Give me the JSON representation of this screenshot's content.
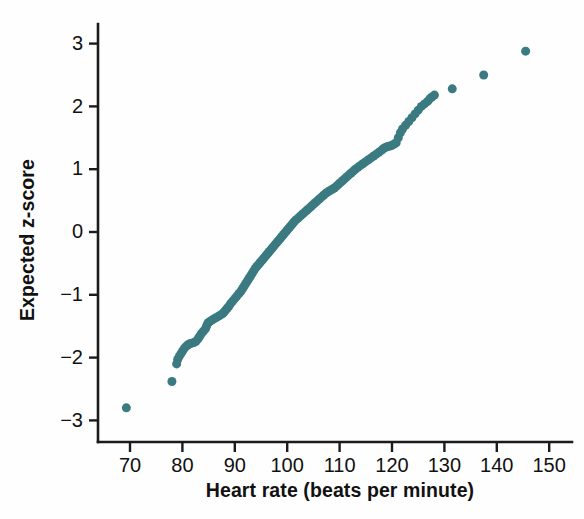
{
  "chart_data": {
    "type": "scatter",
    "title": "",
    "subtitle": "",
    "xlabel": "Heart rate (beats per minute)",
    "ylabel": "Expected z-score",
    "xlim": [
      66,
      152
    ],
    "ylim": [
      -3.35,
      3.35
    ],
    "xticks": [
      70,
      80,
      90,
      100,
      110,
      120,
      130,
      140,
      150
    ],
    "xticklabels": [
      "70",
      "80",
      "90",
      "100",
      "110",
      "120",
      "130",
      "140",
      "150"
    ],
    "yticks": [
      -3,
      -2,
      -1,
      0,
      1,
      2,
      3
    ],
    "yticklabels": [
      "−3",
      "−2",
      "−1",
      "0",
      "1",
      "2",
      "3"
    ],
    "grid": false,
    "legend": null,
    "marker": {
      "shape": "circle",
      "color": "#3a7a80",
      "size_px": 9,
      "opacity": 1
    },
    "series": [
      {
        "name": "Heart rate normal quantile plot",
        "color": "#3a7a80",
        "n_points": 136,
        "x": [
          69.3,
          78.0,
          78.9,
          79.1,
          79.4,
          79.7,
          80.0,
          80.3,
          80.6,
          81.0,
          81.4,
          81.8,
          82.2,
          82.6,
          83.0,
          83.3,
          83.6,
          84.0,
          84.4,
          84.6,
          84.8,
          85.0,
          85.3,
          85.7,
          86.1,
          86.5,
          86.9,
          87.3,
          87.7,
          88.0,
          88.3,
          88.6,
          88.9,
          89.2,
          89.6,
          90.0,
          90.4,
          90.8,
          91.2,
          91.5,
          91.8,
          92.1,
          92.4,
          92.7,
          93.0,
          93.3,
          93.6,
          93.9,
          94.2,
          94.5,
          94.8,
          95.1,
          95.4,
          95.7,
          96.0,
          96.3,
          96.6,
          96.9,
          97.2,
          97.5,
          97.8,
          98.1,
          98.4,
          98.7,
          99.0,
          99.3,
          99.6,
          99.9,
          100.2,
          100.5,
          100.8,
          101.1,
          101.4,
          101.8,
          102.2,
          102.6,
          103.0,
          103.4,
          103.8,
          104.2,
          104.6,
          105.0,
          105.4,
          105.8,
          106.2,
          106.6,
          107.0,
          107.4,
          107.8,
          108.2,
          108.6,
          109.0,
          109.4,
          109.8,
          110.2,
          110.6,
          111.0,
          111.4,
          111.8,
          112.2,
          112.6,
          113.0,
          113.5,
          114.0,
          114.5,
          115.0,
          115.5,
          116.0,
          116.5,
          117.0,
          117.5,
          118.0,
          118.4,
          118.8,
          119.2,
          119.6,
          120.0,
          120.4,
          120.8,
          121.2,
          121.6,
          122.0,
          122.6,
          123.2,
          123.8,
          124.4,
          125.0,
          125.6,
          126.2,
          126.8,
          127.2,
          127.6,
          128.1,
          131.5,
          137.5,
          145.5
        ],
        "y": [
          -2.8,
          -2.38,
          -2.1,
          -2.03,
          -1.98,
          -1.94,
          -1.9,
          -1.86,
          -1.83,
          -1.8,
          -1.78,
          -1.77,
          -1.76,
          -1.74,
          -1.7,
          -1.66,
          -1.62,
          -1.58,
          -1.54,
          -1.5,
          -1.46,
          -1.44,
          -1.42,
          -1.4,
          -1.38,
          -1.36,
          -1.34,
          -1.32,
          -1.3,
          -1.27,
          -1.24,
          -1.21,
          -1.18,
          -1.14,
          -1.1,
          -1.06,
          -1.02,
          -0.98,
          -0.94,
          -0.9,
          -0.86,
          -0.82,
          -0.78,
          -0.74,
          -0.7,
          -0.66,
          -0.62,
          -0.58,
          -0.55,
          -0.52,
          -0.49,
          -0.46,
          -0.43,
          -0.4,
          -0.37,
          -0.34,
          -0.31,
          -0.28,
          -0.25,
          -0.22,
          -0.19,
          -0.16,
          -0.13,
          -0.1,
          -0.07,
          -0.04,
          -0.01,
          0.02,
          0.05,
          0.08,
          0.11,
          0.14,
          0.17,
          0.2,
          0.23,
          0.26,
          0.29,
          0.32,
          0.35,
          0.38,
          0.41,
          0.44,
          0.47,
          0.5,
          0.53,
          0.56,
          0.59,
          0.62,
          0.64,
          0.66,
          0.68,
          0.7,
          0.73,
          0.76,
          0.79,
          0.82,
          0.85,
          0.88,
          0.91,
          0.94,
          0.97,
          1.0,
          1.03,
          1.06,
          1.09,
          1.12,
          1.15,
          1.18,
          1.21,
          1.24,
          1.27,
          1.3,
          1.33,
          1.35,
          1.36,
          1.37,
          1.38,
          1.4,
          1.42,
          1.5,
          1.58,
          1.64,
          1.7,
          1.76,
          1.82,
          1.88,
          1.94,
          2.0,
          2.04,
          2.08,
          2.12,
          2.15,
          2.18,
          2.28,
          2.5,
          2.88
        ]
      }
    ]
  },
  "figure": {
    "background": "#fefefe",
    "axis_color": "#1b1b1b"
  }
}
